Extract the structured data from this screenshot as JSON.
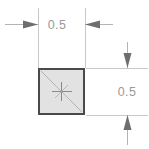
{
  "drawing": {
    "title": "Square dimension drawing",
    "canvas": {
      "width": 149,
      "height": 149,
      "background": "#ffffff"
    },
    "colors": {
      "shape_fill": "#e2e2e2",
      "shape_border": "#4a4a4a",
      "dimension_line": "#b4b4b4",
      "extension_line": "#c8c8c8",
      "arrow_fill": "#6e6e6e",
      "text": "#9a9a9a"
    },
    "shape": {
      "kind": "square",
      "label": "square-profile",
      "x": 38,
      "y": 68,
      "width": 47,
      "height": 47,
      "has_diagonal": true,
      "has_center_mark": true
    },
    "dimensions": [
      {
        "id": "width-dimension",
        "orientation": "horizontal",
        "value": "0.5",
        "label_x": 57,
        "label_y": 29,
        "line_y": 24,
        "line_x1": 5,
        "line_x2": 113,
        "arrow_positions": [
          38,
          85
        ],
        "arrow_directions": [
          "right",
          "left"
        ]
      },
      {
        "id": "height-dimension",
        "orientation": "vertical",
        "value": "0.5",
        "label_x": 127,
        "label_y": 96,
        "line_x": 127,
        "line_y1": 42,
        "line_y2": 145,
        "arrow_positions": [
          68,
          115
        ],
        "arrow_directions": [
          "down",
          "up"
        ]
      }
    ],
    "extension_lines": [
      {
        "id": "ext-left-vertical",
        "x1": 38,
        "y1": 8,
        "x2": 38,
        "y2": 68
      },
      {
        "id": "ext-right-vertical",
        "x1": 85,
        "y1": 8,
        "x2": 85,
        "y2": 68
      },
      {
        "id": "ext-top-horizontal",
        "x1": 85,
        "y1": 68,
        "x2": 148,
        "y2": 68
      },
      {
        "id": "ext-bottom-horizontal",
        "x1": 85,
        "y1": 115,
        "x2": 148,
        "y2": 115
      }
    ]
  }
}
